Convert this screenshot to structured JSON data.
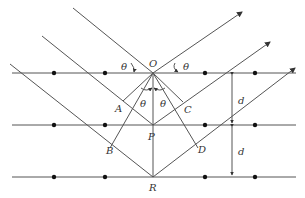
{
  "diagram": {
    "colors": {
      "line": "#555555",
      "dot": "#111111",
      "text": "#333333",
      "background": "#ffffff"
    },
    "planes": [
      {
        "name": "plane-1",
        "y": 73
      },
      {
        "name": "plane-2",
        "y": 125
      },
      {
        "name": "plane-3",
        "y": 177
      }
    ],
    "atom_x": [
      54,
      105,
      205,
      255
    ],
    "labels": {
      "O": "O",
      "P": "P",
      "R": "R",
      "A": "A",
      "B": "B",
      "C": "C",
      "D": "D",
      "theta": "θ",
      "d": "d"
    }
  }
}
